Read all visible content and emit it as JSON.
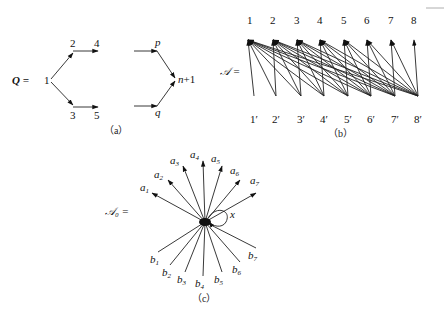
{
  "panel_a": {
    "label": "Q =",
    "caption": "（a）",
    "nodes": {
      "n1": "1",
      "n2": "2",
      "n3": "3",
      "n4": "4",
      "n5": "5",
      "p": "p",
      "q": "q",
      "np1_n": "n",
      "np1_rest": "+1"
    }
  },
  "panel_b": {
    "label": "𝒜 =",
    "caption": "（b）",
    "top_nodes": [
      "1",
      "2",
      "3",
      "4",
      "5",
      "6",
      "7",
      "8"
    ],
    "bottom_nodes": [
      "1′",
      "2′",
      "3′",
      "4′",
      "5′",
      "6′",
      "7′",
      "8′"
    ],
    "edge_rule": "bottom k′ → top j for j ≤ k"
  },
  "panel_c": {
    "label": "𝒜₀ =",
    "caption": "（c）",
    "loop_label": "x",
    "a_labels": [
      "a",
      "a",
      "a",
      "a",
      "a",
      "a",
      "a"
    ],
    "a_subs": [
      "1",
      "2",
      "3",
      "4",
      "5",
      "6",
      "7"
    ],
    "b_labels": [
      "b",
      "b",
      "b",
      "b",
      "b",
      "b",
      "b"
    ],
    "b_subs": [
      "1",
      "2",
      "3",
      "4",
      "5",
      "6",
      "7"
    ]
  }
}
